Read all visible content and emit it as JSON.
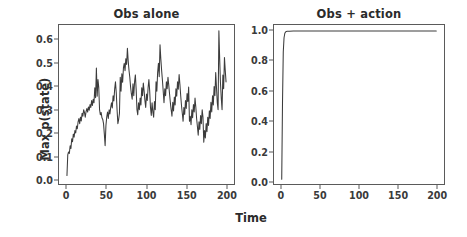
{
  "figure": {
    "xlabel": "Time",
    "ylabel": "Max p(state)",
    "background": "#ffffff",
    "line_color": "#3c3c3c",
    "axis_color": "#5a5a5a"
  },
  "chart_data": [
    {
      "type": "line",
      "title": "Obs alone",
      "xlabel": "Time",
      "ylabel": "Max p(state)",
      "grid": false,
      "legend": "none",
      "xlim": [
        -10,
        210
      ],
      "ylim": [
        -0.02,
        0.665
      ],
      "xticks": [
        0,
        50,
        100,
        150,
        200
      ],
      "xticklabels": [
        "0",
        "50",
        "100",
        "150",
        "200"
      ],
      "yticks": [
        0.0,
        0.1,
        0.2,
        0.3,
        0.4,
        0.5,
        0.6
      ],
      "yticklabels": [
        "0.0",
        "0.1",
        "0.2",
        "0.3",
        "0.4",
        "0.5",
        "0.6"
      ],
      "x": [
        0,
        1,
        2,
        3,
        4,
        5,
        6,
        7,
        8,
        9,
        10,
        11,
        12,
        13,
        14,
        15,
        16,
        17,
        18,
        19,
        20,
        21,
        22,
        23,
        24,
        25,
        26,
        27,
        28,
        29,
        30,
        31,
        32,
        33,
        34,
        35,
        36,
        37,
        38,
        39,
        40,
        41,
        42,
        43,
        44,
        45,
        46,
        47,
        48,
        49,
        50,
        51,
        52,
        53,
        54,
        55,
        56,
        57,
        58,
        59,
        60,
        61,
        62,
        63,
        64,
        65,
        66,
        67,
        68,
        69,
        70,
        71,
        72,
        73,
        74,
        75,
        76,
        77,
        78,
        79,
        80,
        81,
        82,
        83,
        84,
        85,
        86,
        87,
        88,
        89,
        90,
        91,
        92,
        93,
        94,
        95,
        96,
        97,
        98,
        99,
        100,
        101,
        102,
        103,
        104,
        105,
        106,
        107,
        108,
        109,
        110,
        111,
        112,
        113,
        114,
        115,
        116,
        117,
        118,
        119,
        120,
        121,
        122,
        123,
        124,
        125,
        126,
        127,
        128,
        129,
        130,
        131,
        132,
        133,
        134,
        135,
        136,
        137,
        138,
        139,
        140,
        141,
        142,
        143,
        144,
        145,
        146,
        147,
        148,
        149,
        150,
        151,
        152,
        153,
        154,
        155,
        156,
        157,
        158,
        159,
        160,
        161,
        162,
        163,
        164,
        165,
        166,
        167,
        168,
        169,
        170,
        171,
        172,
        173,
        174,
        175,
        176,
        177,
        178,
        179,
        180,
        181,
        182,
        183,
        184,
        185,
        186,
        187,
        188,
        189,
        190,
        191,
        192,
        193,
        194,
        195,
        196,
        197,
        198,
        199,
        200
      ],
      "y": [
        0.017,
        0.105,
        0.118,
        0.112,
        0.145,
        0.133,
        0.175,
        0.162,
        0.195,
        0.182,
        0.21,
        0.2,
        0.23,
        0.218,
        0.248,
        0.262,
        0.24,
        0.268,
        0.252,
        0.285,
        0.272,
        0.3,
        0.288,
        0.268,
        0.292,
        0.305,
        0.29,
        0.312,
        0.298,
        0.322,
        0.31,
        0.34,
        0.318,
        0.345,
        0.33,
        0.395,
        0.352,
        0.48,
        0.358,
        0.43,
        0.395,
        0.3,
        0.278,
        0.288,
        0.265,
        0.258,
        0.24,
        0.195,
        0.145,
        0.232,
        0.268,
        0.29,
        0.262,
        0.3,
        0.282,
        0.31,
        0.33,
        0.308,
        0.36,
        0.338,
        0.39,
        0.42,
        0.372,
        0.3,
        0.24,
        0.258,
        0.285,
        0.44,
        0.38,
        0.455,
        0.418,
        0.48,
        0.5,
        0.468,
        0.52,
        0.495,
        0.565,
        0.51,
        0.47,
        0.44,
        0.398,
        0.368,
        0.345,
        0.412,
        0.36,
        0.42,
        0.45,
        0.388,
        0.3,
        0.278,
        0.33,
        0.3,
        0.35,
        0.32,
        0.395,
        0.36,
        0.415,
        0.38,
        0.34,
        0.31,
        0.368,
        0.34,
        0.395,
        0.43,
        0.382,
        0.31,
        0.275,
        0.33,
        0.29,
        0.268,
        0.335,
        0.3,
        0.42,
        0.38,
        0.46,
        0.5,
        0.442,
        0.58,
        0.52,
        0.47,
        0.428,
        0.38,
        0.33,
        0.39,
        0.36,
        0.42,
        0.39,
        0.44,
        0.405,
        0.368,
        0.33,
        0.3,
        0.272,
        0.332,
        0.295,
        0.355,
        0.32,
        0.39,
        0.358,
        0.42,
        0.388,
        0.452,
        0.41,
        0.36,
        0.318,
        0.285,
        0.25,
        0.31,
        0.28,
        0.34,
        0.305,
        0.37,
        0.335,
        0.398,
        0.25,
        0.272,
        0.235,
        0.3,
        0.265,
        0.322,
        0.29,
        0.35,
        0.312,
        0.262,
        0.228,
        0.19,
        0.248,
        0.215,
        0.275,
        0.24,
        0.3,
        0.268,
        0.16,
        0.21,
        0.178,
        0.24,
        0.205,
        0.268,
        0.232,
        0.295,
        0.262,
        0.332,
        0.29,
        0.36,
        0.32,
        0.4,
        0.36,
        0.46,
        0.395,
        0.33,
        0.3,
        0.64,
        0.52,
        0.415,
        0.35,
        0.3,
        0.45,
        0.39,
        0.525,
        0.47,
        0.42,
        0.48
      ]
    },
    {
      "type": "line",
      "title": "Obs + action",
      "xlabel": "Time",
      "ylabel": "Max p(state)",
      "grid": false,
      "legend": "none",
      "xlim": [
        -10,
        210
      ],
      "ylim": [
        -0.02,
        1.04
      ],
      "xticks": [
        0,
        50,
        100,
        150,
        200
      ],
      "xticklabels": [
        "0",
        "50",
        "100",
        "150",
        "200"
      ],
      "yticks": [
        0.0,
        0.2,
        0.4,
        0.6,
        0.8,
        1.0
      ],
      "yticklabels": [
        "0.0",
        "0.2",
        "0.4",
        "0.6",
        "0.8",
        "1.0"
      ],
      "x": [
        0,
        1,
        2,
        3,
        4,
        5,
        6,
        7,
        8,
        10,
        15,
        20,
        30,
        40,
        60,
        80,
        100,
        120,
        140,
        160,
        180,
        200
      ],
      "y": [
        0.012,
        0.52,
        0.86,
        0.955,
        0.985,
        0.994,
        0.997,
        0.998,
        0.999,
        0.999,
        1.0,
        1.0,
        1.0,
        1.0,
        1.0,
        1.0,
        1.0,
        1.0,
        1.0,
        1.0,
        1.0,
        1.0
      ]
    }
  ]
}
